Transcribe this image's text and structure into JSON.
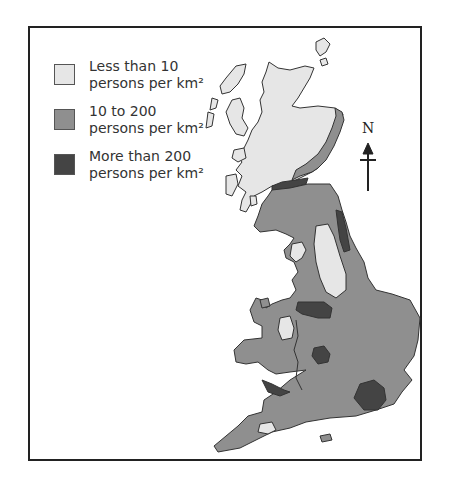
{
  "legend": {
    "items": [
      {
        "line1": "Less than 10",
        "line2": "persons per km²",
        "color": "#e6e6e6"
      },
      {
        "line1": "10 to 200",
        "line2": "persons per km²",
        "color": "#8f8f8f"
      },
      {
        "line1": "More than 200",
        "line2": "persons per km²",
        "color": "#444444"
      }
    ]
  },
  "north_arrow": {
    "label": "N"
  },
  "colors": {
    "low": "#e6e6e6",
    "mid": "#8f8f8f",
    "high": "#444444",
    "outline": "#333333"
  }
}
